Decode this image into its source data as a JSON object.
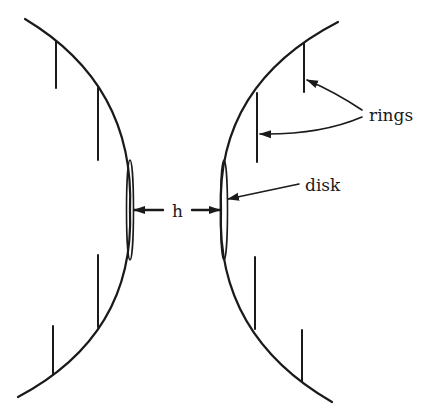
{
  "diagram": {
    "colors": {
      "ink": "#1a1a1a",
      "background": "#ffffff"
    },
    "labels": {
      "gap": "h",
      "rings": "rings",
      "disk": "disk"
    },
    "left_surface": {
      "curve": "M25,19 Q135,85 130,210 Q135,335 18,397",
      "rings": [
        {
          "x": 56,
          "y1": 41,
          "y2": 88
        },
        {
          "x": 98,
          "y1": 88,
          "y2": 160
        },
        {
          "x": 98,
          "y1": 255,
          "y2": 327
        },
        {
          "x": 53,
          "y1": 326,
          "y2": 374
        }
      ],
      "disk": {
        "cx": 130,
        "cy": 210,
        "rx": 3.5,
        "ry": 50
      }
    },
    "right_surface": {
      "curve": "M338,22 Q216,85 221,210 Q216,335 332,402",
      "rings": [
        {
          "x": 304,
          "y1": 43,
          "y2": 92
        },
        {
          "x": 257,
          "y1": 93,
          "y2": 162
        },
        {
          "x": 255,
          "y1": 257,
          "y2": 329
        },
        {
          "x": 302,
          "y1": 330,
          "y2": 381
        }
      ],
      "disk": {
        "cx": 224,
        "cy": 210,
        "rx": 3.5,
        "ry": 50
      }
    },
    "arrows": {
      "gap_left": {
        "from": [
          163,
          210
        ],
        "to": [
          134,
          210
        ]
      },
      "gap_right": {
        "from": [
          192,
          210
        ],
        "to": [
          220,
          210
        ]
      },
      "rings_upper": {
        "path": "M362,110 Q335,92 307,80"
      },
      "rings_lower": {
        "path": "M362,117 Q320,135 260,134"
      },
      "disk": {
        "from": [
          299,
          184
        ],
        "to": [
          228,
          199
        ]
      }
    }
  }
}
